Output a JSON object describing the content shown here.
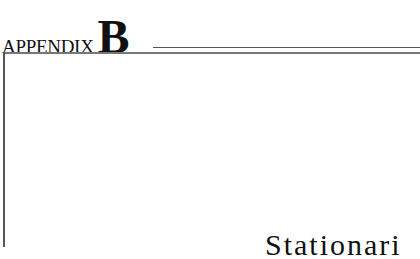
{
  "header": {
    "label": "APPENDIX",
    "letter": "B"
  },
  "title": "Stationari"
}
